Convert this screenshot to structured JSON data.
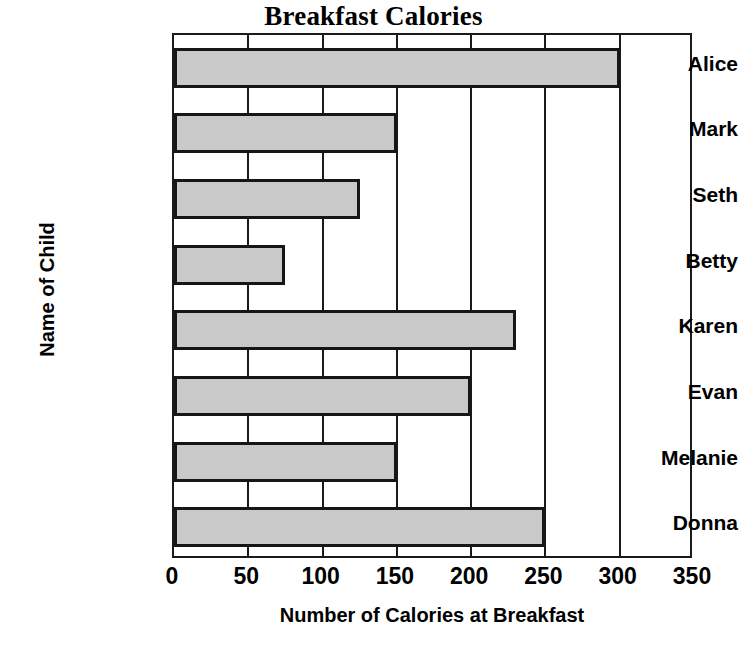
{
  "chart_data": {
    "type": "bar",
    "orientation": "horizontal",
    "title": "Breakfast Calories",
    "xlabel": "Number of Calories at Breakfast",
    "ylabel": "Name of Child",
    "categories": [
      "Alice",
      "Mark",
      "Seth",
      "Betty",
      "Karen",
      "Evan",
      "Melanie",
      "Donna"
    ],
    "values": [
      300,
      150,
      125,
      75,
      230,
      200,
      150,
      250
    ],
    "xlim": [
      0,
      350
    ],
    "xticks": [
      0,
      50,
      100,
      150,
      200,
      250,
      300,
      350
    ],
    "xtick_labels": [
      "0",
      "50",
      "100",
      "150",
      "200",
      "250",
      "300",
      "350"
    ],
    "grid": "vertical",
    "legend": "none",
    "bar_fill_color": "#c9c9c9",
    "bar_edge_color": "#161616",
    "axis_color": "#1a1a1a",
    "background_color": "#ffffff"
  }
}
